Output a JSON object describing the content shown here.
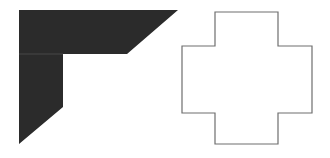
{
  "figure": {
    "background": "#ffffff",
    "shapes": [
      {
        "name": "dark-corner-shape",
        "fill": "#2b2b2b",
        "points": [
          [
            19,
            10
          ],
          [
            178,
            10
          ],
          [
            127,
            54
          ],
          [
            63,
            54
          ],
          [
            63,
            107
          ],
          [
            19,
            144
          ]
        ],
        "divider": {
          "x1": 19,
          "y1": 54,
          "x2": 63,
          "y2": 54,
          "stroke": "#5a5a5a"
        }
      },
      {
        "name": "cross-outline-shape",
        "fill": "#ffffff",
        "stroke": "#6e6e6e",
        "points": [
          [
            215,
            12
          ],
          [
            278,
            12
          ],
          [
            278,
            46
          ],
          [
            312,
            46
          ],
          [
            312,
            113
          ],
          [
            278,
            113
          ],
          [
            278,
            144
          ],
          [
            215,
            144
          ],
          [
            215,
            113
          ],
          [
            182,
            113
          ],
          [
            182,
            46
          ],
          [
            215,
            46
          ]
        ]
      }
    ]
  }
}
